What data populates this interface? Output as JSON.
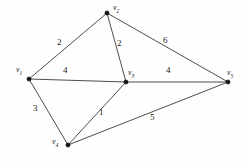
{
  "figure": {
    "background_color": "#fefefe",
    "edge_color": "#3a3a3a",
    "vertex_color": "#111111",
    "text_color": "#1a1a1a"
  },
  "chart_data": {
    "type": "diagram",
    "diagram_kind": "weighted-undirected-graph",
    "title": "",
    "xlabel": "",
    "ylabel": "",
    "grid": false,
    "legend": "none",
    "vertices": [
      {
        "id": "v1",
        "label_prefix": "v",
        "label_sub": "1",
        "label": "v1",
        "x": 29,
        "y": 79,
        "label_x": 16,
        "label_y": 66
      },
      {
        "id": "v2",
        "label_prefix": "v",
        "label_sub": "2",
        "label": "v2",
        "x": 107,
        "y": 13,
        "label_x": 113,
        "label_y": 4
      },
      {
        "id": "v3",
        "label_prefix": "v",
        "label_sub": "3",
        "label": "v3",
        "x": 126,
        "y": 82,
        "label_x": 128,
        "label_y": 69
      },
      {
        "id": "v4",
        "label_prefix": "v",
        "label_sub": "4",
        "label": "v4",
        "x": 68,
        "y": 145,
        "label_x": 52,
        "label_y": 138
      },
      {
        "id": "v5",
        "label_prefix": "v",
        "label_sub": "5",
        "label": "v5",
        "x": 228,
        "y": 82,
        "label_x": 227,
        "label_y": 69
      }
    ],
    "edges": [
      {
        "source": "v1",
        "target": "v2",
        "weight": 2,
        "label_x": 57,
        "label_y": 38
      },
      {
        "source": "v2",
        "target": "v3",
        "weight": 2,
        "label_x": 117,
        "label_y": 39
      },
      {
        "source": "v2",
        "target": "v5",
        "weight": 6,
        "label_x": 163,
        "label_y": 36
      },
      {
        "source": "v1",
        "target": "v3",
        "weight": 4,
        "label_x": 63,
        "label_y": 66
      },
      {
        "source": "v3",
        "target": "v5",
        "weight": 4,
        "label_x": 166,
        "label_y": 66
      },
      {
        "source": "v1",
        "target": "v4",
        "weight": 3,
        "label_x": 33,
        "label_y": 104
      },
      {
        "source": "v3",
        "target": "v4",
        "weight": 1,
        "label_x": 99,
        "label_y": 108
      },
      {
        "source": "v4",
        "target": "v5",
        "weight": 5,
        "label_x": 150,
        "label_y": 113
      }
    ],
    "vertex_count": 5,
    "edge_count": 8,
    "weights": [
      2,
      2,
      6,
      4,
      4,
      3,
      1,
      5
    ]
  }
}
